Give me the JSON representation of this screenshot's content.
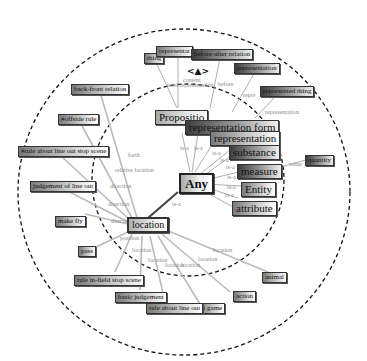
{
  "diagram": {
    "center_node": "Any",
    "hub_node": "location",
    "navigation": {
      "arrows": "<▲>"
    },
    "nodes": {
      "any": "Any",
      "location": "location",
      "proposition": "Propositio",
      "time": "time",
      "representation_form": "representation form",
      "representation": "representation",
      "substance": "substance",
      "measure": "measure",
      "entity": "Entity",
      "attribute": "attribute",
      "quantity": "quantity",
      "thing": "thing",
      "representation_top": "representat",
      "before_after_relation": "before-after relation",
      "representation_outer": "representation",
      "represented_thing": "represented thing",
      "back_front_relation": "back-front relation",
      "offside_rule": "#offside rule",
      "rule_line_out_stop_scene": "#rule about line out stop scene",
      "judgement_of_line_out": "judgement of line out",
      "make_fly": "make fly",
      "pass": "pass",
      "rule_in_field_stop_scene": "rule in-field stop scene",
      "basic_judgement": "basic judgement",
      "rule_about_line_out": "rule about line out",
      "ri_game": "ri game",
      "action": "action",
      "animal": "animal"
    },
    "edge_labels": {
      "content": "content",
      "used_representation": "used representation",
      "before": "before",
      "repre": "repre",
      "representation": "representation",
      "value": "value",
      "is_a": "is-a",
      "forth": "forth",
      "relative_location": "relative location",
      "direction": "direction",
      "position": "position",
      "location": "location"
    }
  }
}
